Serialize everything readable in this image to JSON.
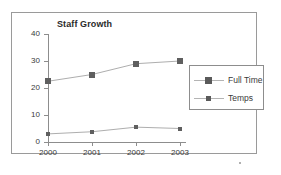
{
  "chart_data": {
    "type": "line",
    "title": "Staff Growth",
    "xlabel": "",
    "ylabel": "",
    "categories": [
      "2000",
      "2001",
      "2002",
      "2003"
    ],
    "x": [
      2000,
      2001,
      2002,
      2003
    ],
    "ylim": [
      0,
      40
    ],
    "yticks": [
      0,
      10,
      20,
      30,
      40
    ],
    "ytick_labels": [
      "0",
      "10",
      "20",
      "30",
      "40"
    ],
    "xtick_labels": [
      "2000",
      "2001",
      "2002",
      "2003"
    ],
    "grid": false,
    "legend_position": "right",
    "series": [
      {
        "name": "Full Time",
        "values": [
          22.5,
          25,
          29,
          30
        ],
        "color": "#808080",
        "marker": "square",
        "marker_size": "large"
      },
      {
        "name": "Temps",
        "values": [
          3,
          3.8,
          5.5,
          5
        ],
        "color": "#808080",
        "marker": "square",
        "marker_size": "small"
      }
    ]
  },
  "frame": {
    "border_color": "#9a9a9a",
    "background": "#ffffff"
  },
  "axis": {
    "line_color": "#8d8d8d",
    "tick_color": "#8d8d8d",
    "label_color": "#3a3a3a"
  },
  "legend": {
    "border_color": "#8d8d8d",
    "entries": [
      {
        "label": "Full Time"
      },
      {
        "label": "Temps"
      }
    ]
  }
}
